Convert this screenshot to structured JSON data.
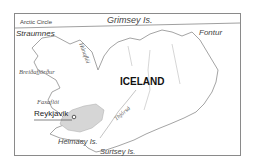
{
  "map": {
    "title": "ICELAND",
    "labels": {
      "arctic_circle": "Arctic Circle",
      "grimsey": "Grimsey Is.",
      "straumnes": "Straumnes",
      "fontur": "Fontur",
      "hunafloi": "Húnaflói",
      "breidafjordur": "Breiðafjörður",
      "faxafloi": "Faxaflói",
      "reykjavik": "Reykjavik",
      "thjorsa": "Thjórsá",
      "heimaey": "Heimaey Is.",
      "surtsey": "Surtsey Is."
    },
    "colors": {
      "frame": "#8a8a8a",
      "coast": "#9a9a9a",
      "shaded_region": "#d6d6d6",
      "text": "#333333"
    }
  }
}
